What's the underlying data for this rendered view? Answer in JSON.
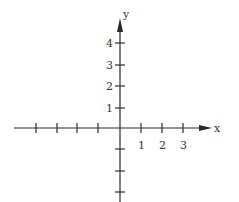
{
  "diagram": {
    "type": "coordinate-axes",
    "x_axis": {
      "label": "x",
      "tick_labels": [
        "1",
        "2",
        "3"
      ],
      "positive_ticks": 3,
      "negative_ticks": 4
    },
    "y_axis": {
      "label": "y",
      "tick_labels": [
        "1",
        "2",
        "3",
        "4"
      ],
      "positive_ticks": 4,
      "negative_ticks": 3
    },
    "colors": {
      "axis": "#2a2a2a",
      "text": "#333333",
      "background": "#ffffff"
    }
  }
}
